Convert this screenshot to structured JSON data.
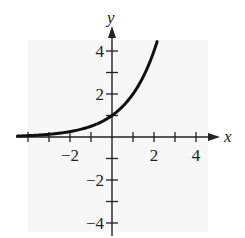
{
  "chart_data": {
    "type": "line",
    "title": "",
    "function": "y = 2^x",
    "xlabel": "x",
    "ylabel": "y",
    "xlim": [
      -4.5,
      4.5
    ],
    "ylim": [
      -4.6,
      5.2
    ],
    "x_ticks": [
      -4,
      -3,
      -2,
      -1,
      1,
      2,
      3,
      4
    ],
    "x_tick_labels": [
      "-2",
      "2",
      "4"
    ],
    "x_tick_label_values": [
      -2,
      2,
      4
    ],
    "y_ticks": [
      -4,
      -3,
      -2,
      -1,
      1,
      2,
      3,
      4
    ],
    "y_tick_labels": [
      "4",
      "2",
      "-2",
      "-4"
    ],
    "y_tick_label_values": [
      4,
      2,
      -2,
      -4
    ],
    "grid": false,
    "legend": null,
    "series": [
      {
        "name": "curve",
        "x": [
          -4.5,
          -4,
          -3,
          -2,
          -1,
          0,
          1,
          2,
          2.15
        ],
        "y": [
          0.044,
          0.0625,
          0.125,
          0.25,
          0.5,
          1,
          2,
          4,
          4.44
        ]
      }
    ],
    "colors": {
      "curve": "#111111",
      "axes": "#222222",
      "background_panel": "#f7f7f7"
    }
  }
}
